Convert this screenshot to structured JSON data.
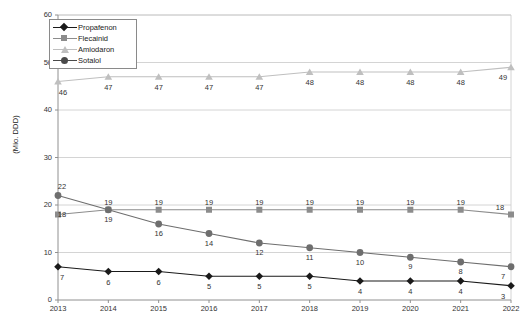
{
  "chart_data": {
    "type": "line",
    "title": "",
    "xlabel": "",
    "ylabel": "(Mio. DDD)",
    "categories": [
      "2013",
      "2014",
      "2015",
      "2016",
      "2017",
      "2018",
      "2019",
      "2020",
      "2021",
      "2022"
    ],
    "ylim": [
      0,
      60
    ],
    "yticks": [
      "0",
      "10",
      "20",
      "30",
      "40",
      "50",
      "60"
    ],
    "grid": true,
    "legend_position": "top-left",
    "series": [
      {
        "name": "Propafenon",
        "marker": "diamond",
        "color": "#1a1a1a",
        "values": [
          7,
          6,
          6,
          5,
          5,
          5,
          4,
          4,
          4,
          3
        ],
        "labels": [
          "7",
          "6",
          "6",
          "5",
          "5",
          "5",
          "4",
          "4",
          "4",
          "3"
        ]
      },
      {
        "name": "Flecainid",
        "marker": "square",
        "color": "#8c8c8c",
        "values": [
          18,
          19,
          19,
          19,
          19,
          19,
          19,
          19,
          19,
          18
        ],
        "labels": [
          "18",
          "19",
          "19",
          "19",
          "19",
          "19",
          "19",
          "19",
          "19",
          "18"
        ]
      },
      {
        "name": "Amiodaron",
        "marker": "triangle",
        "color": "#bfbfbf",
        "values": [
          46,
          47,
          47,
          47,
          47,
          48,
          48,
          48,
          48,
          49
        ],
        "labels": [
          "46",
          "47",
          "47",
          "47",
          "47",
          "48",
          "48",
          "48",
          "48",
          "49"
        ]
      },
      {
        "name": "Sotalol",
        "marker": "circle",
        "color": "#6e6e6e",
        "values": [
          22,
          19,
          16,
          14,
          12,
          11,
          10,
          9,
          8,
          7
        ],
        "labels": [
          "22",
          "19",
          "16",
          "14",
          "12",
          "11",
          "10",
          "9",
          "8",
          "7"
        ]
      }
    ]
  },
  "axis": {
    "y_label": "(Mio. DDD)",
    "y_ticks": [
      "60",
      "50",
      "40",
      "30",
      "20",
      "10",
      "0"
    ],
    "x_ticks": [
      "2013",
      "2014",
      "2015",
      "2016",
      "2017",
      "2018",
      "2019",
      "2020",
      "2021",
      "2022"
    ]
  },
  "legend": {
    "items": [
      {
        "label": "Propafenon"
      },
      {
        "label": "Flecainid"
      },
      {
        "label": "Amiodaron"
      },
      {
        "label": "Sotalol"
      }
    ]
  },
  "colors": {
    "propafenon": "#1a1a1a",
    "flecainid": "#8c8c8c",
    "amiodaron": "#bfbfbf",
    "sotalol": "#6e6e6e",
    "grid": "#c9c9c9",
    "axis": "#909090"
  }
}
